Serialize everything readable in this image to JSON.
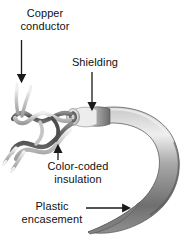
{
  "figure": {
    "background_color": "#ffffff",
    "labels": {
      "copper_conductor": {
        "line1": "Copper",
        "line2": "conductor"
      },
      "shielding": {
        "line1": "Shielding"
      },
      "color_coded_insulation": {
        "line1": "Color-coded",
        "line2": "insulation"
      },
      "plastic_encasement": {
        "line1": "Plastic",
        "line2": "encasement"
      }
    },
    "colors": {
      "text": "#111111",
      "arrow": "#1a1a1a",
      "jacket_dark": "#6e6e6e",
      "jacket_mid": "#9a9a9a",
      "jacket_light": "#d8d8d8",
      "shield_ring": "#ececec",
      "wire_dark": "#595959",
      "wire_light": "#c9c9c9"
    },
    "arrows": [
      {
        "name": "copper-conductor-arrow",
        "direction": "down"
      },
      {
        "name": "shielding-arrow",
        "direction": "down"
      },
      {
        "name": "color-coded-insulation-arrow",
        "direction": "up"
      },
      {
        "name": "plastic-encasement-arrow",
        "direction": "right"
      }
    ]
  }
}
